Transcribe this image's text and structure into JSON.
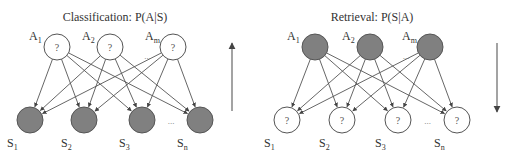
{
  "panels": [
    {
      "id": "classification",
      "title": "Classification: P(A|S)",
      "attributes": [
        {
          "name": "A",
          "sub": "1",
          "x": 57,
          "y": 47,
          "state": "unknown",
          "mark": "?"
        },
        {
          "name": "A",
          "sub": "2",
          "x": 110,
          "y": 47,
          "state": "unknown",
          "mark": "?"
        },
        {
          "name": "A",
          "sub": "m",
          "x": 173,
          "y": 47,
          "state": "unknown",
          "mark": "?"
        }
      ],
      "attribute_ellipsis": "...",
      "samples": [
        {
          "name": "S",
          "sub": "1",
          "x": 30,
          "y": 120,
          "state": "observed",
          "mark": ""
        },
        {
          "name": "S",
          "sub": "2",
          "x": 84,
          "y": 120,
          "state": "observed",
          "mark": ""
        },
        {
          "name": "S",
          "sub": "3",
          "x": 142,
          "y": 120,
          "state": "observed",
          "mark": ""
        },
        {
          "name": "S",
          "sub": "n",
          "x": 200,
          "y": 120,
          "state": "observed",
          "mark": ""
        }
      ],
      "sample_ellipsis": "...",
      "direction": "up",
      "arrow_x": 232
    },
    {
      "id": "retrieval",
      "title": "Retrieval: P(S|A)",
      "attributes": [
        {
          "name": "A",
          "sub": "1",
          "x": 315,
          "y": 47,
          "state": "observed",
          "mark": ""
        },
        {
          "name": "A",
          "sub": "2",
          "x": 370,
          "y": 47,
          "state": "observed",
          "mark": ""
        },
        {
          "name": "A",
          "sub": "m",
          "x": 430,
          "y": 47,
          "state": "observed",
          "mark": ""
        }
      ],
      "attribute_ellipsis": "...",
      "samples": [
        {
          "name": "S",
          "sub": "1",
          "x": 287,
          "y": 120,
          "state": "unknown",
          "mark": "?"
        },
        {
          "name": "S",
          "sub": "2",
          "x": 342,
          "y": 120,
          "state": "unknown",
          "mark": "?"
        },
        {
          "name": "S",
          "sub": "3",
          "x": 398,
          "y": 120,
          "state": "unknown",
          "mark": "?"
        },
        {
          "name": "S",
          "sub": "n",
          "x": 457,
          "y": 120,
          "state": "unknown",
          "mark": "?"
        }
      ],
      "sample_ellipsis": "...",
      "direction": "down",
      "arrow_x": 497
    }
  ],
  "style": {
    "filled_color": "#808080",
    "stroke_color": "#555555",
    "node_radius": 13
  }
}
